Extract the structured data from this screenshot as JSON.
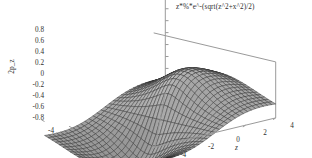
{
  "plot": {
    "title": "z*%*e^-(sqrt(z^2+x^2)/2)",
    "background_color": "#ffffff",
    "line_color": "#2e2e2e",
    "surface_color": "#8c8c8c",
    "axis_color": "#9a9a9a"
  },
  "axes": {
    "y": {
      "label": "2p_z",
      "ticks": [
        "0.8",
        "0.6",
        "0.4",
        "0.2",
        "0",
        "-0.2",
        "-0.4",
        "-0.6",
        "-0.8"
      ],
      "min": -0.8,
      "max": 0.8
    },
    "x": {
      "label": "x",
      "ticks": [
        "-4",
        "-2",
        "0",
        "2",
        "4"
      ],
      "min": -4,
      "max": 4
    },
    "z": {
      "label": "z",
      "ticks": [
        "-4",
        "-2",
        "0",
        "2",
        "4"
      ],
      "min": -4,
      "max": 4
    }
  },
  "chart_data": {
    "type": "surface",
    "title": "z*%*e^-(sqrt(z^2+x^2)/2)",
    "xlabel": "x",
    "ylabel": "2p_z",
    "zlabel": "z",
    "xlim": [
      -4,
      4
    ],
    "zlim": [
      -4,
      4
    ],
    "ylim": [
      -0.8,
      0.8
    ],
    "grid": true,
    "legend": "none",
    "formula": "f(x,z) = z * exp(-sqrt(z^2 + x^2) / 2)",
    "mesh_rows": 30,
    "mesh_cols": 30,
    "view": {
      "elevation": 22,
      "azimuth": -58
    },
    "x_ticks": [
      -4,
      -2,
      0,
      2,
      4
    ],
    "z_ticks": [
      -4,
      -2,
      0,
      2,
      4
    ],
    "y_ticks": [
      -0.8,
      -0.6,
      -0.4,
      -0.2,
      0,
      0.2,
      0.4,
      0.6,
      0.8
    ]
  }
}
